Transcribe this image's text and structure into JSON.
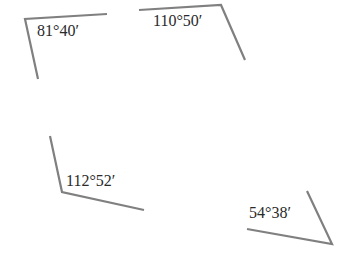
{
  "diagram": {
    "type": "angle-figures",
    "stroke_color": "#808080",
    "text_color": "#2a2a2a",
    "angles": [
      {
        "label": "81°40′",
        "vertex": [
          25,
          19
        ],
        "arm1_end": [
          107,
          14
        ],
        "arm2_end": [
          38,
          79
        ],
        "label_pos": [
          37,
          23
        ]
      },
      {
        "label": "110°50′",
        "vertex": [
          221,
          5
        ],
        "arm1_end": [
          139,
          10
        ],
        "arm2_end": [
          245,
          60
        ],
        "label_pos": [
          153,
          13
        ]
      },
      {
        "label": "112°52′",
        "vertex": [
          62,
          192
        ],
        "arm1_end": [
          50,
          136
        ],
        "arm2_end": [
          144,
          210
        ],
        "label_pos": [
          66,
          173
        ]
      },
      {
        "label": "54°38′",
        "vertex": [
          332,
          244
        ],
        "arm1_end": [
          247,
          229
        ],
        "arm2_end": [
          307,
          191
        ],
        "label_pos": [
          249,
          205
        ]
      }
    ]
  }
}
